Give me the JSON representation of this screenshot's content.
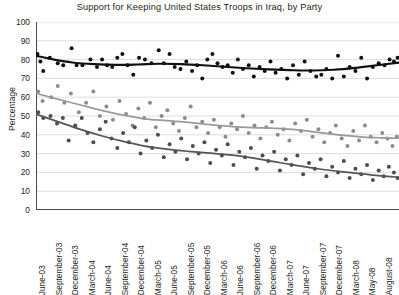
{
  "chart_data": {
    "type": "scatter",
    "title": "Support for Keeping United States Troops in Iraq, by Party",
    "xlabel": "",
    "ylabel": "Percentage",
    "ylim": [
      0,
      100
    ],
    "ytick_step": 10,
    "yticks": [
      100,
      90,
      80,
      70,
      60,
      50,
      40,
      30,
      20,
      10,
      0
    ],
    "grid": "horizontal",
    "legend": "none",
    "categories": [
      "June-03",
      "September-03",
      "December-03",
      "March-04",
      "June-04",
      "September-04",
      "December-04",
      "March-05",
      "June-05",
      "September-05",
      "December-05",
      "March-06",
      "June-06",
      "September-06",
      "December-06",
      "March-07",
      "June-07",
      "September-07",
      "December-07",
      "March-08",
      "May-08",
      "August-08"
    ],
    "xtick_labels": [
      "June-03",
      "September-03",
      "December-03",
      "March-04",
      "June-04",
      "September-04",
      "December-04",
      "March-05",
      "June-05",
      "September-05",
      "December-05",
      "March-06",
      "June-06",
      "September-06",
      "December-06",
      "March-07",
      "June-07",
      "September-07",
      "December-07",
      "March-08",
      "May-08",
      "August-08"
    ],
    "series": [
      {
        "name": "Republicans",
        "color": "#111111",
        "trend_color": "#111111",
        "trend": [
          {
            "x": 0.0,
            "y": 82
          },
          {
            "x": 0.05,
            "y": 80
          },
          {
            "x": 0.1,
            "y": 78.5
          },
          {
            "x": 0.16,
            "y": 77.6
          },
          {
            "x": 0.22,
            "y": 77.2
          },
          {
            "x": 0.28,
            "y": 77.4
          },
          {
            "x": 0.34,
            "y": 77.8
          },
          {
            "x": 0.4,
            "y": 77.6
          },
          {
            "x": 0.46,
            "y": 77.0
          },
          {
            "x": 0.52,
            "y": 76.2
          },
          {
            "x": 0.58,
            "y": 75.4
          },
          {
            "x": 0.64,
            "y": 74.8
          },
          {
            "x": 0.7,
            "y": 74.4
          },
          {
            "x": 0.76,
            "y": 74.2
          },
          {
            "x": 0.82,
            "y": 74.6
          },
          {
            "x": 0.88,
            "y": 75.6
          },
          {
            "x": 0.94,
            "y": 77.0
          },
          {
            "x": 1.0,
            "y": 78.4
          }
        ],
        "points": [
          {
            "x": 0.004,
            "y": 83
          },
          {
            "x": 0.012,
            "y": 79
          },
          {
            "x": 0.02,
            "y": 74
          },
          {
            "x": 0.038,
            "y": 81
          },
          {
            "x": 0.06,
            "y": 78
          },
          {
            "x": 0.075,
            "y": 77
          },
          {
            "x": 0.098,
            "y": 86
          },
          {
            "x": 0.112,
            "y": 77
          },
          {
            "x": 0.128,
            "y": 77
          },
          {
            "x": 0.15,
            "y": 80
          },
          {
            "x": 0.168,
            "y": 76
          },
          {
            "x": 0.182,
            "y": 80
          },
          {
            "x": 0.196,
            "y": 77
          },
          {
            "x": 0.21,
            "y": 76
          },
          {
            "x": 0.224,
            "y": 81
          },
          {
            "x": 0.238,
            "y": 83
          },
          {
            "x": 0.252,
            "y": 77
          },
          {
            "x": 0.268,
            "y": 72
          },
          {
            "x": 0.284,
            "y": 81
          },
          {
            "x": 0.3,
            "y": 80
          },
          {
            "x": 0.318,
            "y": 78
          },
          {
            "x": 0.338,
            "y": 85
          },
          {
            "x": 0.352,
            "y": 78
          },
          {
            "x": 0.368,
            "y": 83
          },
          {
            "x": 0.382,
            "y": 76
          },
          {
            "x": 0.398,
            "y": 75
          },
          {
            "x": 0.414,
            "y": 79
          },
          {
            "x": 0.43,
            "y": 74
          },
          {
            "x": 0.444,
            "y": 77
          },
          {
            "x": 0.458,
            "y": 70
          },
          {
            "x": 0.472,
            "y": 80
          },
          {
            "x": 0.486,
            "y": 83
          },
          {
            "x": 0.5,
            "y": 78
          },
          {
            "x": 0.514,
            "y": 76
          },
          {
            "x": 0.528,
            "y": 77
          },
          {
            "x": 0.542,
            "y": 73
          },
          {
            "x": 0.556,
            "y": 80
          },
          {
            "x": 0.57,
            "y": 75
          },
          {
            "x": 0.586,
            "y": 77
          },
          {
            "x": 0.6,
            "y": 71
          },
          {
            "x": 0.616,
            "y": 76
          },
          {
            "x": 0.63,
            "y": 74
          },
          {
            "x": 0.646,
            "y": 79
          },
          {
            "x": 0.66,
            "y": 73
          },
          {
            "x": 0.676,
            "y": 75
          },
          {
            "x": 0.692,
            "y": 70
          },
          {
            "x": 0.708,
            "y": 77
          },
          {
            "x": 0.724,
            "y": 72
          },
          {
            "x": 0.74,
            "y": 79
          },
          {
            "x": 0.756,
            "y": 74
          },
          {
            "x": 0.772,
            "y": 71
          },
          {
            "x": 0.786,
            "y": 72
          },
          {
            "x": 0.8,
            "y": 75
          },
          {
            "x": 0.816,
            "y": 70
          },
          {
            "x": 0.832,
            "y": 82
          },
          {
            "x": 0.848,
            "y": 71
          },
          {
            "x": 0.864,
            "y": 76
          },
          {
            "x": 0.88,
            "y": 74
          },
          {
            "x": 0.896,
            "y": 81
          },
          {
            "x": 0.912,
            "y": 70
          },
          {
            "x": 0.928,
            "y": 76
          },
          {
            "x": 0.944,
            "y": 78
          },
          {
            "x": 0.96,
            "y": 77
          },
          {
            "x": 0.974,
            "y": 80
          },
          {
            "x": 0.986,
            "y": 79
          },
          {
            "x": 0.996,
            "y": 81
          }
        ]
      },
      {
        "name": "Independents",
        "color": "#8c8c8c",
        "trend_color": "#9a9a9a",
        "trend": [
          {
            "x": 0.0,
            "y": 62
          },
          {
            "x": 0.06,
            "y": 59
          },
          {
            "x": 0.12,
            "y": 56
          },
          {
            "x": 0.18,
            "y": 53
          },
          {
            "x": 0.24,
            "y": 50.5
          },
          {
            "x": 0.3,
            "y": 48.5
          },
          {
            "x": 0.36,
            "y": 47.5
          },
          {
            "x": 0.42,
            "y": 46.6
          },
          {
            "x": 0.48,
            "y": 45.4
          },
          {
            "x": 0.54,
            "y": 44.4
          },
          {
            "x": 0.6,
            "y": 43.8
          },
          {
            "x": 0.66,
            "y": 43.4
          },
          {
            "x": 0.72,
            "y": 42.6
          },
          {
            "x": 0.78,
            "y": 41.2
          },
          {
            "x": 0.84,
            "y": 39.8
          },
          {
            "x": 0.9,
            "y": 38.8
          },
          {
            "x": 0.95,
            "y": 38.4
          },
          {
            "x": 1.0,
            "y": 38.2
          }
        ],
        "points": [
          {
            "x": 0.006,
            "y": 63
          },
          {
            "x": 0.018,
            "y": 58
          },
          {
            "x": 0.042,
            "y": 60
          },
          {
            "x": 0.06,
            "y": 66
          },
          {
            "x": 0.078,
            "y": 57
          },
          {
            "x": 0.096,
            "y": 62
          },
          {
            "x": 0.118,
            "y": 52
          },
          {
            "x": 0.138,
            "y": 57
          },
          {
            "x": 0.158,
            "y": 63
          },
          {
            "x": 0.176,
            "y": 50
          },
          {
            "x": 0.194,
            "y": 55
          },
          {
            "x": 0.212,
            "y": 48
          },
          {
            "x": 0.23,
            "y": 58
          },
          {
            "x": 0.248,
            "y": 51
          },
          {
            "x": 0.266,
            "y": 45
          },
          {
            "x": 0.282,
            "y": 54
          },
          {
            "x": 0.298,
            "y": 49
          },
          {
            "x": 0.314,
            "y": 57
          },
          {
            "x": 0.33,
            "y": 44
          },
          {
            "x": 0.346,
            "y": 50
          },
          {
            "x": 0.362,
            "y": 53
          },
          {
            "x": 0.378,
            "y": 46
          },
          {
            "x": 0.394,
            "y": 42
          },
          {
            "x": 0.41,
            "y": 49
          },
          {
            "x": 0.426,
            "y": 55
          },
          {
            "x": 0.442,
            "y": 44
          },
          {
            "x": 0.458,
            "y": 47
          },
          {
            "x": 0.474,
            "y": 41
          },
          {
            "x": 0.49,
            "y": 48
          },
          {
            "x": 0.506,
            "y": 44
          },
          {
            "x": 0.522,
            "y": 39
          },
          {
            "x": 0.538,
            "y": 46
          },
          {
            "x": 0.554,
            "y": 43
          },
          {
            "x": 0.57,
            "y": 50
          },
          {
            "x": 0.586,
            "y": 41
          },
          {
            "x": 0.602,
            "y": 45
          },
          {
            "x": 0.618,
            "y": 38
          },
          {
            "x": 0.634,
            "y": 44
          },
          {
            "x": 0.65,
            "y": 47
          },
          {
            "x": 0.666,
            "y": 40
          },
          {
            "x": 0.682,
            "y": 43
          },
          {
            "x": 0.698,
            "y": 37
          },
          {
            "x": 0.714,
            "y": 46
          },
          {
            "x": 0.73,
            "y": 42
          },
          {
            "x": 0.746,
            "y": 48
          },
          {
            "x": 0.762,
            "y": 39
          },
          {
            "x": 0.778,
            "y": 43
          },
          {
            "x": 0.794,
            "y": 36
          },
          {
            "x": 0.81,
            "y": 41
          },
          {
            "x": 0.826,
            "y": 45
          },
          {
            "x": 0.842,
            "y": 38
          },
          {
            "x": 0.858,
            "y": 34
          },
          {
            "x": 0.874,
            "y": 42
          },
          {
            "x": 0.89,
            "y": 37
          },
          {
            "x": 0.906,
            "y": 45
          },
          {
            "x": 0.922,
            "y": 39
          },
          {
            "x": 0.938,
            "y": 36
          },
          {
            "x": 0.954,
            "y": 41
          },
          {
            "x": 0.968,
            "y": 38
          },
          {
            "x": 0.982,
            "y": 34
          },
          {
            "x": 0.994,
            "y": 39
          }
        ]
      },
      {
        "name": "Democrats",
        "color": "#4d4d4d",
        "trend_color": "#555555",
        "trend": [
          {
            "x": 0.0,
            "y": 51
          },
          {
            "x": 0.06,
            "y": 47
          },
          {
            "x": 0.12,
            "y": 43
          },
          {
            "x": 0.18,
            "y": 39.5
          },
          {
            "x": 0.24,
            "y": 36.5
          },
          {
            "x": 0.3,
            "y": 34
          },
          {
            "x": 0.36,
            "y": 32.4
          },
          {
            "x": 0.42,
            "y": 31.2
          },
          {
            "x": 0.48,
            "y": 30.2
          },
          {
            "x": 0.54,
            "y": 29.2
          },
          {
            "x": 0.6,
            "y": 27.6
          },
          {
            "x": 0.66,
            "y": 25.6
          },
          {
            "x": 0.72,
            "y": 23.6
          },
          {
            "x": 0.78,
            "y": 21.8
          },
          {
            "x": 0.84,
            "y": 20.4
          },
          {
            "x": 0.9,
            "y": 19.2
          },
          {
            "x": 0.95,
            "y": 18.2
          },
          {
            "x": 1.0,
            "y": 17.4
          }
        ],
        "points": [
          {
            "x": 0.006,
            "y": 52
          },
          {
            "x": 0.02,
            "y": 49
          },
          {
            "x": 0.04,
            "y": 50
          },
          {
            "x": 0.058,
            "y": 46
          },
          {
            "x": 0.074,
            "y": 49
          },
          {
            "x": 0.09,
            "y": 37
          },
          {
            "x": 0.108,
            "y": 45
          },
          {
            "x": 0.126,
            "y": 49
          },
          {
            "x": 0.142,
            "y": 41
          },
          {
            "x": 0.158,
            "y": 36
          },
          {
            "x": 0.176,
            "y": 43
          },
          {
            "x": 0.192,
            "y": 47
          },
          {
            "x": 0.208,
            "y": 38
          },
          {
            "x": 0.224,
            "y": 33
          },
          {
            "x": 0.24,
            "y": 41
          },
          {
            "x": 0.256,
            "y": 36
          },
          {
            "x": 0.272,
            "y": 44
          },
          {
            "x": 0.288,
            "y": 30
          },
          {
            "x": 0.304,
            "y": 37
          },
          {
            "x": 0.32,
            "y": 33
          },
          {
            "x": 0.336,
            "y": 40
          },
          {
            "x": 0.352,
            "y": 28
          },
          {
            "x": 0.368,
            "y": 35
          },
          {
            "x": 0.384,
            "y": 31
          },
          {
            "x": 0.4,
            "y": 38
          },
          {
            "x": 0.416,
            "y": 27
          },
          {
            "x": 0.432,
            "y": 34
          },
          {
            "x": 0.448,
            "y": 30
          },
          {
            "x": 0.464,
            "y": 36
          },
          {
            "x": 0.48,
            "y": 25
          },
          {
            "x": 0.496,
            "y": 32
          },
          {
            "x": 0.512,
            "y": 29
          },
          {
            "x": 0.528,
            "y": 35
          },
          {
            "x": 0.544,
            "y": 24
          },
          {
            "x": 0.56,
            "y": 31
          },
          {
            "x": 0.576,
            "y": 28
          },
          {
            "x": 0.592,
            "y": 33
          },
          {
            "x": 0.608,
            "y": 22
          },
          {
            "x": 0.624,
            "y": 29
          },
          {
            "x": 0.64,
            "y": 26
          },
          {
            "x": 0.656,
            "y": 31
          },
          {
            "x": 0.672,
            "y": 21
          },
          {
            "x": 0.688,
            "y": 27
          },
          {
            "x": 0.704,
            "y": 24
          },
          {
            "x": 0.72,
            "y": 29
          },
          {
            "x": 0.736,
            "y": 19
          },
          {
            "x": 0.752,
            "y": 25
          },
          {
            "x": 0.768,
            "y": 22
          },
          {
            "x": 0.784,
            "y": 27
          },
          {
            "x": 0.8,
            "y": 18
          },
          {
            "x": 0.816,
            "y": 23
          },
          {
            "x": 0.832,
            "y": 20
          },
          {
            "x": 0.848,
            "y": 26
          },
          {
            "x": 0.864,
            "y": 17
          },
          {
            "x": 0.88,
            "y": 22
          },
          {
            "x": 0.896,
            "y": 19
          },
          {
            "x": 0.912,
            "y": 24
          },
          {
            "x": 0.928,
            "y": 16
          },
          {
            "x": 0.944,
            "y": 21
          },
          {
            "x": 0.958,
            "y": 18
          },
          {
            "x": 0.972,
            "y": 23
          },
          {
            "x": 0.986,
            "y": 20
          },
          {
            "x": 0.996,
            "y": 17
          }
        ]
      }
    ]
  }
}
